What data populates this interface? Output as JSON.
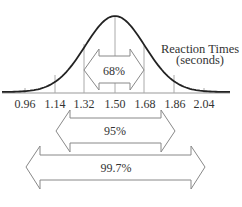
{
  "chart_data": {
    "type": "area",
    "subtype": "normal-distribution",
    "title": "Reaction Times (seconds)",
    "title_lines": [
      "Reaction Times",
      "(seconds)"
    ],
    "xlabel": "",
    "ylabel": "",
    "mean": 1.5,
    "std_dev": 0.18,
    "x_ticks": [
      "0.96",
      "1.14",
      "1.32",
      "1.50",
      "1.68",
      "1.86",
      "2.04"
    ],
    "x_values": [
      0.96,
      1.14,
      1.32,
      1.5,
      1.68,
      1.86,
      2.04
    ],
    "intervals": [
      {
        "label": "68%",
        "from": 1.32,
        "to": 1.68,
        "sigma": 1
      },
      {
        "label": "95%",
        "from": 1.14,
        "to": 1.86,
        "sigma": 2
      },
      {
        "label": "99.7%",
        "from": 0.96,
        "to": 2.04,
        "sigma": 3
      }
    ],
    "grid": false,
    "legend": "none",
    "colors": {
      "curve": "#222222",
      "lines": "#999999",
      "text": "#333333"
    }
  }
}
